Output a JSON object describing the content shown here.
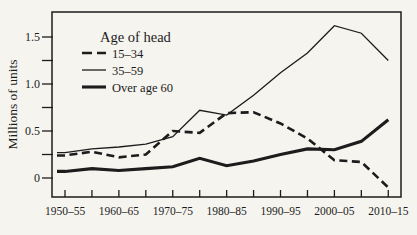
{
  "chart_data": {
    "type": "line",
    "title": "",
    "legend_title": "Age of head",
    "legend_position": "upper-left-inside",
    "ylabel": "Millions of units",
    "xlabel": "",
    "grid": false,
    "ylim": [
      -0.2,
      1.77
    ],
    "y_ticks_labeled": [
      0,
      0.5,
      1.0,
      1.5
    ],
    "y_minor_ticks": [
      0.25,
      0.75,
      1.25
    ],
    "categories": [
      "1950–55",
      "1955–60",
      "1960–65",
      "1965–70",
      "1970–75",
      "1975–80",
      "1980–85",
      "1985–90",
      "1990–95",
      "1995–2000",
      "2000–05",
      "2005–10",
      "2010–15"
    ],
    "x_tick_labels_shown": [
      "1950–55",
      "1960–65",
      "1970–75",
      "1980–85",
      "1990–95",
      "2000–05",
      "2010–15"
    ],
    "series": [
      {
        "name": "15–34",
        "line_style": "dashed",
        "line_weight": "medium",
        "values": [
          0.24,
          0.28,
          0.22,
          0.25,
          0.5,
          0.48,
          0.69,
          0.7,
          0.58,
          0.42,
          0.19,
          0.17,
          -0.1
        ]
      },
      {
        "name": "35–59",
        "line_style": "solid",
        "line_weight": "thin",
        "values": [
          0.27,
          0.31,
          0.33,
          0.36,
          0.44,
          0.72,
          0.67,
          0.88,
          1.12,
          1.33,
          1.62,
          1.54,
          1.25
        ]
      },
      {
        "name": "Over age 60",
        "line_style": "solid",
        "line_weight": "thick",
        "values": [
          0.07,
          0.1,
          0.08,
          0.1,
          0.12,
          0.21,
          0.13,
          0.18,
          0.25,
          0.31,
          0.3,
          0.39,
          0.62
        ]
      }
    ],
    "ink_color": "#1c1c1c",
    "paper_color": "#f6f4ef"
  }
}
